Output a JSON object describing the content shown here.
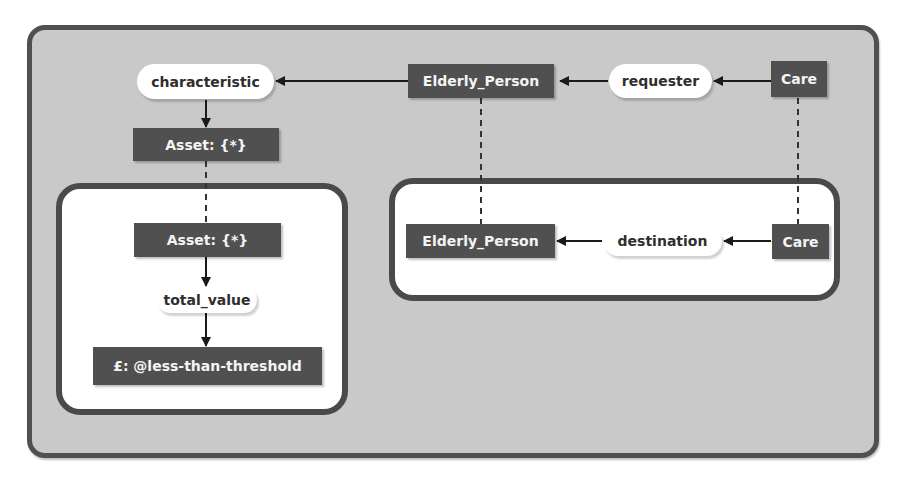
{
  "diagram": {
    "type": "conceptual-graph",
    "outer_context": {
      "concepts": {
        "elderly_person": "Elderly_Person",
        "care": "Care",
        "asset": "Asset: {*}"
      },
      "relations": {
        "characteristic": "characteristic",
        "requester": "requester"
      }
    },
    "left_context": {
      "concepts": {
        "asset": "Asset: {*}",
        "value": "£: @less-than-threshold"
      },
      "relations": {
        "total_value": "total_value"
      }
    },
    "right_context": {
      "concepts": {
        "elderly_person": "Elderly_Person",
        "care": "Care"
      },
      "relations": {
        "destination": "destination"
      }
    },
    "edges": [
      {
        "from": "Care",
        "via": "requester",
        "to": "Elderly_Person"
      },
      {
        "from": "Elderly_Person",
        "via": "characteristic",
        "to": "Asset: {*}"
      },
      {
        "from": "Asset: {*}",
        "via": "total_value",
        "to": "£: @less-than-threshold"
      },
      {
        "from": "Care",
        "via": "destination",
        "to": "Elderly_Person"
      }
    ],
    "coreference_links": [
      {
        "between": [
          "Asset: {*} (outer)",
          "Asset: {*} (left context)"
        ]
      },
      {
        "between": [
          "Elderly_Person (outer)",
          "Elderly_Person (right context)"
        ]
      },
      {
        "between": [
          "Care (outer)",
          "Care (right context)"
        ]
      }
    ],
    "colors": {
      "outer_fill": "#c9c9c9",
      "outer_border": "#505050",
      "inner_fill": "#ffffff",
      "inner_border": "#4a4a4a",
      "concept_fill": "#505050",
      "concept_text": "#f4f4f4",
      "relation_fill": "#ffffff",
      "relation_text": "#2e2e2e",
      "edge": "#1a1a1a"
    }
  }
}
